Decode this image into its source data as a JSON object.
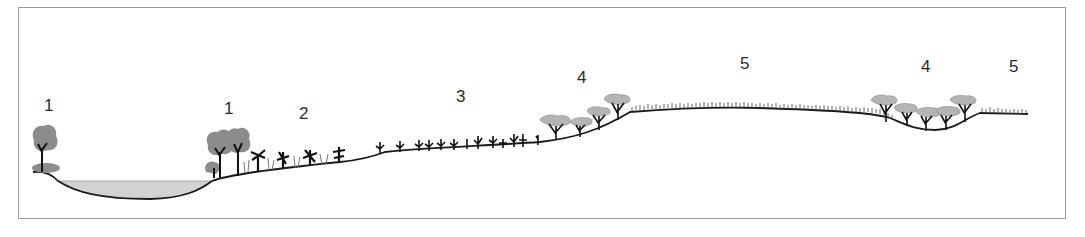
{
  "diagram": {
    "type": "landscape-cross-section",
    "colors": {
      "frame": "#9a9a9a",
      "ground_line": "#1a1a1a",
      "water": "#d2d2d2",
      "canopy": "#8c8c8c",
      "flat_canopy": "#b4b4b4",
      "trunk": "#111111",
      "grass": "#555555"
    },
    "labels": [
      {
        "id": "zone-1-left",
        "text": "1",
        "x": 44,
        "y": 97
      },
      {
        "id": "zone-1-right",
        "text": "1",
        "x": 224,
        "y": 100
      },
      {
        "id": "zone-2",
        "text": "2",
        "x": 299,
        "y": 105
      },
      {
        "id": "zone-3",
        "text": "3",
        "x": 456,
        "y": 88
      },
      {
        "id": "zone-4-left",
        "text": "4",
        "x": 577,
        "y": 69
      },
      {
        "id": "zone-5-left",
        "text": "5",
        "x": 740,
        "y": 55
      },
      {
        "id": "zone-4-right",
        "text": "4",
        "x": 921,
        "y": 58
      },
      {
        "id": "zone-5-right",
        "text": "5",
        "x": 1009,
        "y": 58
      }
    ],
    "zones": [
      {
        "id": 1,
        "description": "riparian trees beside water body"
      },
      {
        "id": 2,
        "description": "shrubs and tall grasses"
      },
      {
        "id": 3,
        "description": "small saplings on gentle slope"
      },
      {
        "id": 4,
        "description": "flat-topped trees (savanna)"
      },
      {
        "id": 5,
        "description": "short grassland plateau"
      }
    ]
  }
}
